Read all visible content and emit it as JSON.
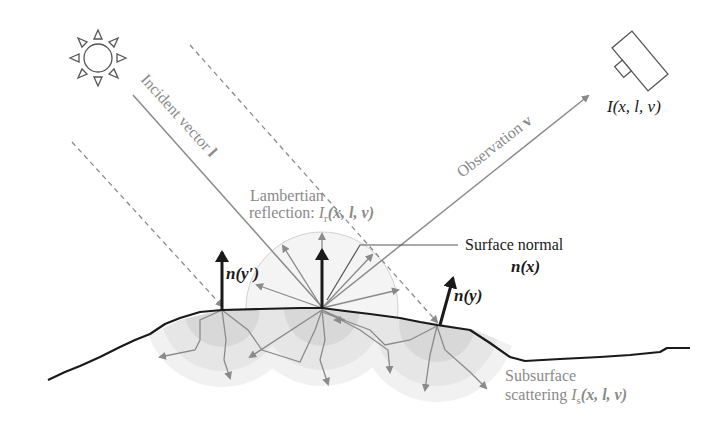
{
  "figure": {
    "type": "physics illustration"
  },
  "labels": {
    "incident_vector": "Incident vector",
    "incident_symbol": "l",
    "observation": "Observation",
    "observation_symbol": "v",
    "camera_intensity": "I(x, l, v)",
    "lambertian_line1": "Lambertian",
    "lambertian_line2": "reflection: ",
    "lambertian_symbol": "I",
    "lambertian_sub": "r",
    "lambertian_args": "(x, l, v)",
    "surface_normal": "Surface normal",
    "surface_normal_symbol": "n(x)",
    "normal_y": "n(y)",
    "normal_y_prime": "n(y′)",
    "subsurface_line1": "Subsurface",
    "subsurface_line2": "scattering ",
    "subsurface_symbol": "I",
    "subsurface_sub": "s",
    "subsurface_args": "(x, l, v)"
  },
  "icons": {
    "light_source": "sun-icon",
    "camera": "camera-icon"
  },
  "colors": {
    "stroke_dark": "#1a1a1a",
    "stroke_gray": "#8a8a8a",
    "scatter_fill_light": "#efefef",
    "scatter_fill_mid": "#e2e2e2",
    "scatter_fill_dark": "#d4d4d4"
  }
}
